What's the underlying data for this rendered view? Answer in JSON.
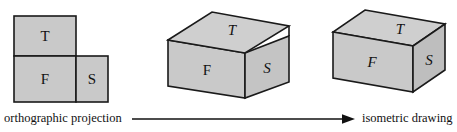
{
  "figure": {
    "colors": {
      "face_fill": "#c9c9c9",
      "face_fill_light": "#d0d0d0",
      "face_fill_dark": "#bcbcbc",
      "stroke": "#1a1a1a",
      "text": "#111111",
      "background": "#ffffff"
    }
  },
  "captions": {
    "left": "orthographic projection",
    "right": "isometric drawing",
    "arrow_icon": "arrow-right-icon"
  },
  "stages": [
    {
      "id": "orthographic",
      "name": "orthographic-projection-figure",
      "letter_style": "upright",
      "faces": [
        {
          "key": "T",
          "label": "T",
          "name": "top-view"
        },
        {
          "key": "F",
          "label": "F",
          "name": "front-view"
        },
        {
          "key": "S",
          "label": "S",
          "name": "side-view"
        }
      ]
    },
    {
      "id": "folding",
      "name": "partially-folded-box-figure",
      "letter_style": "italic",
      "faces": [
        {
          "key": "T",
          "label": "T",
          "name": "top-face-lid"
        },
        {
          "key": "F",
          "label": "F",
          "name": "front-face"
        },
        {
          "key": "S",
          "label": "S",
          "name": "side-face-flared"
        }
      ]
    },
    {
      "id": "isometric",
      "name": "isometric-box-figure",
      "letter_style": "italic",
      "faces": [
        {
          "key": "T",
          "label": "T",
          "name": "top-face"
        },
        {
          "key": "F",
          "label": "F",
          "name": "front-face"
        },
        {
          "key": "S",
          "label": "S",
          "name": "side-face"
        }
      ]
    }
  ]
}
